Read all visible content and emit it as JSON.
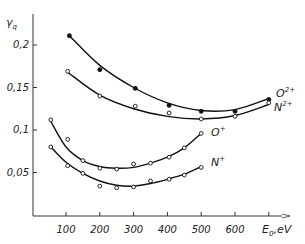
{
  "chart_data": {
    "type": "scatter",
    "title": "",
    "xlabel": "E0, eV",
    "ylabel": "γq",
    "xlim": [
      0,
      720
    ],
    "ylim": [
      0,
      0.23
    ],
    "grid": false,
    "x_ticks": [
      100,
      200,
      300,
      400,
      500,
      600,
      700
    ],
    "x_tick_labels": [
      "100",
      "200",
      "300",
      "400",
      "500",
      "600"
    ],
    "y_ticks": [
      0.05,
      0.1,
      0.15,
      0.2
    ],
    "y_tick_labels": [
      "0,05",
      "0,1",
      "0,15",
      "0,2"
    ],
    "series": [
      {
        "name": "O2+",
        "label_base": "O",
        "label_sup": "2+",
        "marker": "filled-circle",
        "x": [
          110,
          200,
          305,
          405,
          500,
          600,
          700
        ],
        "y": [
          0.211,
          0.171,
          0.149,
          0.129,
          0.122,
          0.122,
          0.136
        ],
        "fit": [
          [
            110,
            0.211
          ],
          [
            200,
            0.176
          ],
          [
            300,
            0.15
          ],
          [
            400,
            0.132
          ],
          [
            500,
            0.123
          ],
          [
            600,
            0.124
          ],
          [
            700,
            0.137
          ]
        ]
      },
      {
        "name": "N2+",
        "label_base": "N",
        "label_sup": "2+",
        "marker": "open-circle",
        "x": [
          105,
          200,
          305,
          405,
          500,
          600,
          700
        ],
        "y": [
          0.169,
          0.14,
          0.128,
          0.12,
          0.113,
          0.116,
          0.132
        ],
        "fit": [
          [
            105,
            0.168
          ],
          [
            200,
            0.141
          ],
          [
            300,
            0.125
          ],
          [
            400,
            0.116
          ],
          [
            500,
            0.113
          ],
          [
            600,
            0.117
          ],
          [
            700,
            0.13
          ]
        ]
      },
      {
        "name": "O+",
        "label_base": "O",
        "label_sup": "+",
        "marker": "open-circle",
        "x": [
          55,
          105,
          150,
          200,
          250,
          300,
          350,
          405,
          450,
          500
        ],
        "y": [
          0.112,
          0.089,
          0.064,
          0.055,
          0.054,
          0.06,
          0.061,
          0.068,
          0.079,
          0.096
        ],
        "fit": [
          [
            55,
            0.11
          ],
          [
            100,
            0.08
          ],
          [
            150,
            0.064
          ],
          [
            200,
            0.057
          ],
          [
            250,
            0.055
          ],
          [
            300,
            0.056
          ],
          [
            350,
            0.061
          ],
          [
            400,
            0.068
          ],
          [
            450,
            0.079
          ],
          [
            500,
            0.096
          ]
        ]
      },
      {
        "name": "N+",
        "label_base": "N",
        "label_sup": "+",
        "marker": "open-circle",
        "x": [
          55,
          105,
          150,
          200,
          250,
          300,
          350,
          405,
          450,
          500
        ],
        "y": [
          0.08,
          0.058,
          0.049,
          0.034,
          0.032,
          0.033,
          0.04,
          0.042,
          0.047,
          0.056
        ],
        "fit": [
          [
            55,
            0.08
          ],
          [
            100,
            0.062
          ],
          [
            150,
            0.049
          ],
          [
            200,
            0.04
          ],
          [
            250,
            0.035
          ],
          [
            300,
            0.034
          ],
          [
            350,
            0.037
          ],
          [
            400,
            0.042
          ],
          [
            450,
            0.048
          ],
          [
            500,
            0.057
          ]
        ]
      }
    ],
    "legend": "inline labels at right end of each curve"
  }
}
